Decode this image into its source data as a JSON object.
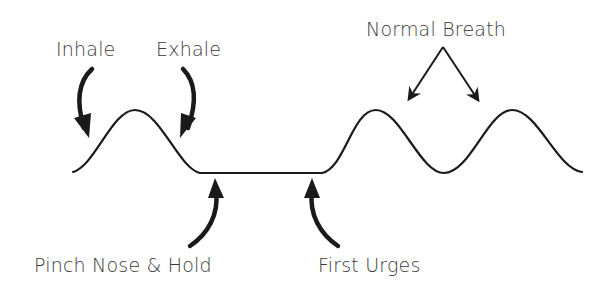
{
  "diagram": {
    "type": "breathing-technique-waveform",
    "labels": {
      "inhale": "Inhale",
      "exhale": "Exhale",
      "normal_breath": "Normal Breath",
      "pinch_nose_hold": "Pinch Nose & Hold",
      "first_urges": "First Urges"
    },
    "colors": {
      "line": "#1a1a1a",
      "text": "#3a3a3a",
      "background": "#ffffff"
    },
    "phases": [
      {
        "name": "Inhale",
        "segment": "rising edge of first breath"
      },
      {
        "name": "Exhale",
        "segment": "falling edge of first breath"
      },
      {
        "name": "Pinch Nose & Hold",
        "segment": "start of flat breath-hold"
      },
      {
        "name": "First Urges",
        "segment": "end of flat breath-hold"
      },
      {
        "name": "Normal Breath",
        "segment": "two following breath waves"
      }
    ]
  }
}
